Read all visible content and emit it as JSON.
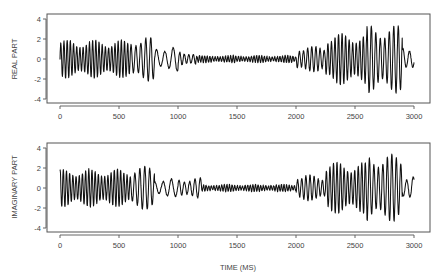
{
  "chart_data": [
    {
      "type": "line",
      "title": "",
      "xlabel": "",
      "ylabel": "REAL PART",
      "xlim": [
        0,
        3000
      ],
      "ylim": [
        -4,
        4
      ],
      "xticks": [
        0,
        500,
        1000,
        1500,
        2000,
        2500,
        3000
      ],
      "yticks": [
        -4,
        -2,
        0,
        2,
        4
      ],
      "grid": false,
      "legend": null,
      "series": [
        {
          "name": "real",
          "color": "#111111",
          "segments": [
            {
              "t0": 0,
              "t1": 600,
              "amp": 1.9,
              "period": 27
            },
            {
              "t0": 600,
              "t1": 800,
              "amp": 2.2,
              "period": 42
            },
            {
              "t0": 800,
              "t1": 1000,
              "amp": 1.2,
              "period": 70
            },
            {
              "t0": 1000,
              "t1": 1150,
              "amp": 0.7,
              "period": 38
            },
            {
              "t0": 1150,
              "t1": 2000,
              "amp": 0.35,
              "period": 22
            },
            {
              "t0": 2000,
              "t1": 2250,
              "amp": 1.3,
              "period": 35
            },
            {
              "t0": 2250,
              "t1": 2600,
              "amp": 2.6,
              "period": 30
            },
            {
              "t0": 2600,
              "t1": 2900,
              "amp": 3.4,
              "period": 38
            },
            {
              "t0": 2900,
              "t1": 3000,
              "amp": 1.3,
              "period": 55
            }
          ]
        }
      ]
    },
    {
      "type": "line",
      "title": "",
      "xlabel": "TIME (MS)",
      "ylabel": "IMAGINARY PART",
      "xlim": [
        0,
        3000
      ],
      "ylim": [
        -4,
        4
      ],
      "xticks": [
        0,
        500,
        1000,
        1500,
        2000,
        2500,
        3000
      ],
      "yticks": [
        -4,
        -2,
        0,
        2,
        4
      ],
      "grid": false,
      "legend": null,
      "series": [
        {
          "name": "imaginary",
          "color": "#111111",
          "segments": [
            {
              "t0": 0,
              "t1": 600,
              "amp": 1.9,
              "period": 27
            },
            {
              "t0": 600,
              "t1": 800,
              "amp": 2.2,
              "period": 42
            },
            {
              "t0": 800,
              "t1": 1000,
              "amp": 0.9,
              "period": 70
            },
            {
              "t0": 1000,
              "t1": 1200,
              "amp": 1.0,
              "period": 45
            },
            {
              "t0": 1200,
              "t1": 2000,
              "amp": 0.35,
              "period": 22
            },
            {
              "t0": 2000,
              "t1": 2250,
              "amp": 1.3,
              "period": 35
            },
            {
              "t0": 2250,
              "t1": 2600,
              "amp": 2.6,
              "period": 30
            },
            {
              "t0": 2600,
              "t1": 2900,
              "amp": 3.4,
              "period": 38
            },
            {
              "t0": 2900,
              "t1": 3000,
              "amp": 1.3,
              "period": 55
            }
          ]
        }
      ]
    }
  ],
  "panels": [
    {
      "ylabel": "REAL PART"
    },
    {
      "ylabel": "IMAGINARY PART"
    }
  ],
  "xaxis_title": "TIME (MS)",
  "tick_labels": {
    "x": [
      "0",
      "500",
      "1000",
      "1500",
      "2000",
      "2500",
      "3000"
    ],
    "y": [
      "4",
      "2",
      "0",
      "-2",
      "-4"
    ]
  }
}
